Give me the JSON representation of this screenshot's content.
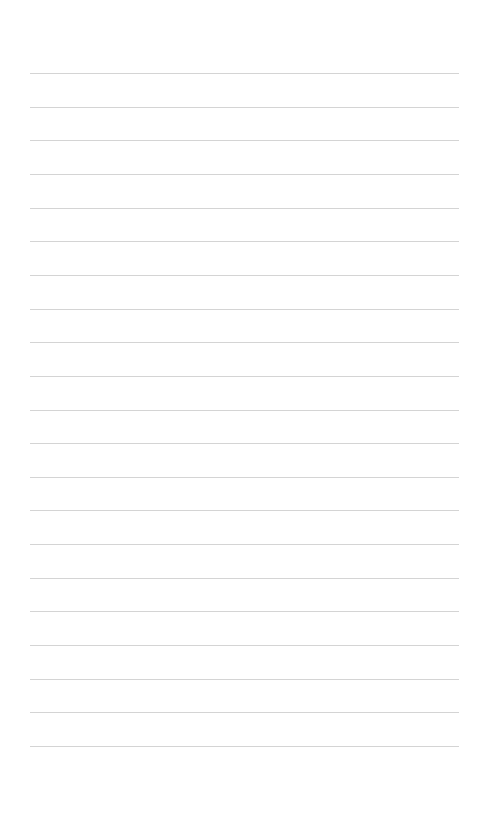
{
  "page": {
    "type": "ruled-paper",
    "line_count": 21,
    "line_color": "#d4d4d4",
    "background_color": "#ffffff",
    "first_line_y": 73,
    "line_spacing": 33.65
  }
}
